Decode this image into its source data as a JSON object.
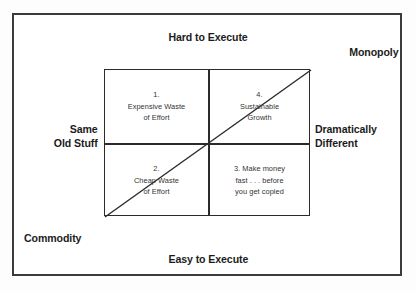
{
  "figure": {
    "type": "2x2-matrix-diagram",
    "background_color": "#fdfdfd",
    "border_color": "#3b3b3b",
    "line_color": "#2b2b2b",
    "text_color": "#1c1c1c"
  },
  "axes": {
    "top_label": "Hard to Execute",
    "bottom_label": "Easy to Execute",
    "left_label_line1": "Same",
    "left_label_line2": "Old Stuff",
    "right_label_line1": "Dramatically",
    "right_label_line2": "Different"
  },
  "corners": {
    "top_right": "Monopoly",
    "bottom_left": "Commodity"
  },
  "quadrants": {
    "q1": {
      "number": "1.",
      "line1": "Expensive Waste",
      "line2": "of Effort"
    },
    "q4": {
      "number": "4.",
      "line1": "Sustainable",
      "line2": "Growth"
    },
    "q2": {
      "number": "2.",
      "line1": "Cheap Waste",
      "line2": "of Effort"
    },
    "q3": {
      "number": "3. Make money",
      "line1": "fast . . . before",
      "line2": "you get copied"
    }
  },
  "diagonal": {
    "description": "arrow-free line from bottom-left corner to top-right corner of the matrix"
  }
}
